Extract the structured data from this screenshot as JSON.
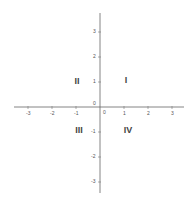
{
  "diagram": {
    "title": "",
    "type": "cartesian-coordinate-plane",
    "axes": {
      "color": "#555555",
      "x_range": [
        -3,
        3
      ],
      "y_range": [
        -3,
        3
      ],
      "origin_label": "0",
      "x_ticks": [
        {
          "value": -3,
          "label": "-3"
        },
        {
          "value": -2,
          "label": "-2"
        },
        {
          "value": -1,
          "label": "-1"
        },
        {
          "value": 0,
          "label": "0"
        },
        {
          "value": 1,
          "label": "1"
        },
        {
          "value": 2,
          "label": "2"
        },
        {
          "value": 3,
          "label": "3"
        }
      ],
      "y_ticks": [
        {
          "value": 3,
          "label": "3"
        },
        {
          "value": 2,
          "label": "2"
        },
        {
          "value": 1,
          "label": "1"
        },
        {
          "value": 0,
          "label": "0"
        },
        {
          "value": -1,
          "label": "-1"
        },
        {
          "value": -2,
          "label": "-2"
        },
        {
          "value": -3,
          "label": "-3"
        }
      ]
    },
    "quadrants": [
      {
        "id": "I",
        "label": "I"
      },
      {
        "id": "II",
        "label": "II"
      },
      {
        "id": "III",
        "label": "III"
      },
      {
        "id": "IV",
        "label": "IV"
      }
    ]
  }
}
